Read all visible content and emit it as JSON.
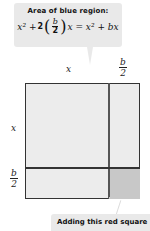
{
  "callout_top": {
    "title": "Area of blue region:",
    "equation": {
      "x2_left": "x² + ",
      "coef": "2",
      "frac_num": "b",
      "frac_den": "2",
      "rest": "x = x² + bx",
      "full_text": "x² + 2(b/2)x = x² + bx"
    }
  },
  "labels": {
    "top_x": "x",
    "top_b_num": "b",
    "top_b_den": "2",
    "left_x": "x",
    "left_b_num": "b",
    "left_b_den": "2"
  },
  "callout_bottom": {
    "text": "Adding this red square"
  },
  "colors": {
    "blue_region": "#ececec",
    "red_square": "#c8c8c8",
    "callout_bg": "#e9e9e9",
    "outline": "#333333"
  }
}
